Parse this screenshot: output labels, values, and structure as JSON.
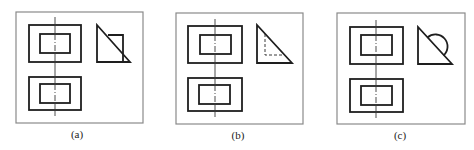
{
  "figure": {
    "panels": [
      {
        "id": "a",
        "label": "(a)",
        "description": "Two-view drawing; side view is a right triangle with an overlapping solid rectangle"
      },
      {
        "id": "b",
        "label": "(b)",
        "description": "Two-view drawing; side view is a right triangle with a dashed (hidden) rectangle inside"
      },
      {
        "id": "c",
        "label": "(c)",
        "description": "Two-view drawing; side view is a right triangle with a semicircle on its hypotenuse"
      }
    ],
    "colors": {
      "frame": "#8a8a8a",
      "outline": "#1e1e1e",
      "centerline": "#3a3a3a",
      "background": "#ffffff"
    }
  }
}
